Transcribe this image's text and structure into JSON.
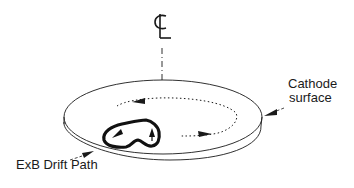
{
  "diagram": {
    "centerline_symbol": "CL",
    "labels": {
      "cathode_line1": "Cathode",
      "cathode_line2": "surface",
      "drift_path": "ExB Drift Path"
    },
    "elements": [
      {
        "name": "centerline-axis",
        "style": "dash-dot",
        "orientation": "vertical"
      },
      {
        "name": "cathode-disc",
        "shape": "elliptical disc with thickness"
      },
      {
        "name": "azimuthal-drift-orbit",
        "style": "dotted",
        "direction": "counter-clockwise (viewed from above)"
      },
      {
        "name": "exb-drift-loop",
        "style": "thick solid closed loop with arrows"
      }
    ],
    "colors": {
      "line": "#1a1a1a",
      "background": "#ffffff"
    }
  }
}
